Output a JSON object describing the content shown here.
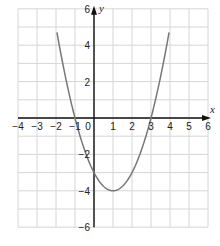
{
  "chart_data": {
    "type": "line",
    "title": "",
    "xlabel": "x",
    "ylabel": "y",
    "xlim": [
      -4,
      6
    ],
    "ylim": [
      -6,
      6
    ],
    "grid": true,
    "x_ticks": [
      "-4",
      "-3",
      "-2",
      "-1",
      "0",
      "1",
      "2",
      "3",
      "4",
      "5",
      "6"
    ],
    "y_ticks": [
      "6",
      "4",
      "2",
      "-2",
      "-4",
      "-6"
    ],
    "series": [
      {
        "name": "y = x^2 - 2x - 3",
        "function": "x^2 - 2x - 3",
        "x": [
          -1.9,
          -1,
          0,
          1,
          2,
          3,
          3.9
        ],
        "y": [
          5.41,
          0,
          -3,
          -4,
          -3,
          0,
          5.41
        ]
      }
    ],
    "colors": {
      "curve": "#777777",
      "grid": "#d6d6d6",
      "axis": "#111111"
    }
  }
}
